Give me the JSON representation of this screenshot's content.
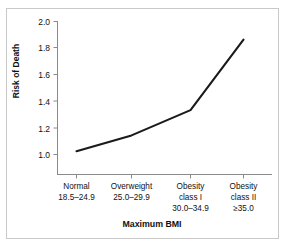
{
  "chart_data": {
    "type": "line",
    "title": "",
    "xlabel": "Maximum BMI",
    "ylabel": "Risk of Death",
    "categories": [
      "Normal 18.5–24.9",
      "Overweight 25.0–29.9",
      "Obesity class I 30.0–34.9",
      "Obesity class II ≥35.0"
    ],
    "category_lines": [
      [
        "Normal",
        "18.5–24.9"
      ],
      [
        "Overweight",
        "25.0–29.9"
      ],
      [
        "Obesity",
        "class I",
        "30.0–34.9"
      ],
      [
        "Obesity",
        "class II",
        "≥35.0"
      ]
    ],
    "values": [
      1.02,
      1.14,
      1.33,
      1.86
    ],
    "ylim": [
      1.0,
      2.0
    ],
    "yticks": [
      "1.0",
      "1.2",
      "1.4",
      "1.6",
      "1.8",
      "2.0"
    ],
    "ytick_values": [
      1.0,
      1.2,
      1.4,
      1.6,
      1.8,
      2.0
    ],
    "grid": false,
    "legend": "none",
    "line_color": "#1a1a1a",
    "axis_color": "#8a8a8a",
    "frame_color": "#c9c9c9"
  },
  "axis": {
    "y_title": "Risk of Death",
    "x_title": "Maximum BMI"
  }
}
